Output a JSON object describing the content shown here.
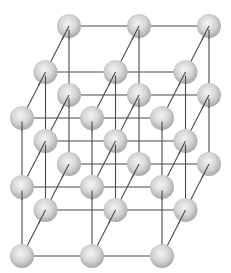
{
  "diagram": {
    "type": "crystal-lattice",
    "grid": {
      "nx": 3,
      "ny": 3,
      "nz": 3
    },
    "origin": {
      "x": 69,
      "y": 26
    },
    "step_x": {
      "dx": 70,
      "dy": 0
    },
    "step_y": {
      "dx": 0,
      "dy": 69
    },
    "step_z": {
      "dx": -23.5,
      "dy": 46
    },
    "atom_radius": 12,
    "colors": {
      "background": "#ffffff",
      "bond": "#4a4a4a",
      "atom_highlight": "#f4f4f4",
      "atom_mid": "#d6d6d6",
      "atom_edge": "#a9a9a9"
    }
  }
}
